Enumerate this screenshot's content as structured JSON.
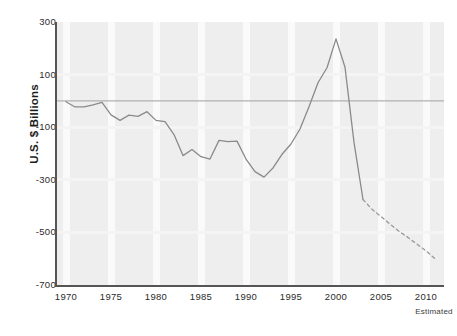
{
  "chart_data": {
    "type": "line",
    "title": "",
    "xlabel": "",
    "ylabel": "U.S. $ Billions",
    "xlim": [
      1969,
      2012
    ],
    "ylim": [
      -700,
      300
    ],
    "ytick_labels": [
      "300",
      "100",
      "-100",
      "-300",
      "-500",
      "-700"
    ],
    "ytick_values": [
      300,
      100,
      -100,
      -300,
      -500,
      -700
    ],
    "xtick_labels": [
      "1970",
      "1975",
      "1980",
      "1985",
      "1990",
      "1995",
      "2000",
      "2005",
      "2010"
    ],
    "xtick_values": [
      1970,
      1975,
      1980,
      1985,
      1990,
      1995,
      2000,
      2005,
      2010
    ],
    "grid": "vertical-bands",
    "legend": "none",
    "annotations": [
      {
        "text": "Estimated",
        "x": 2010,
        "position": "below-axis-right"
      }
    ],
    "zero_reference_line": 0,
    "series": [
      {
        "name": "Actual",
        "style": "solid",
        "color": "#8a8a8a",
        "x": [
          1970,
          1971,
          1972,
          1973,
          1974,
          1975,
          1976,
          1977,
          1978,
          1979,
          1980,
          1981,
          1982,
          1983,
          1984,
          1985,
          1986,
          1987,
          1988,
          1989,
          1990,
          1991,
          1992,
          1993,
          1994,
          1995,
          1996,
          1997,
          1998,
          1999,
          2000,
          2001,
          2002,
          2003
        ],
        "values": [
          -3,
          -23,
          -23,
          -15,
          -6,
          -53,
          -74,
          -54,
          -59,
          -41,
          -74,
          -79,
          -128,
          -208,
          -185,
          -212,
          -221,
          -150,
          -155,
          -153,
          -221,
          -269,
          -290,
          -255,
          -203,
          -164,
          -107,
          -22,
          69,
          126,
          236,
          128,
          -158,
          -375
        ]
      },
      {
        "name": "Estimated",
        "style": "dashed",
        "color": "#9a9a9a",
        "x": [
          2003,
          2004,
          2005,
          2006,
          2007,
          2008,
          2009,
          2010,
          2011
        ],
        "values": [
          -375,
          -412,
          -440,
          -468,
          -496,
          -519,
          -545,
          -570,
          -600
        ]
      }
    ]
  },
  "axis": {
    "y_title": "U.S. $ Billions"
  }
}
